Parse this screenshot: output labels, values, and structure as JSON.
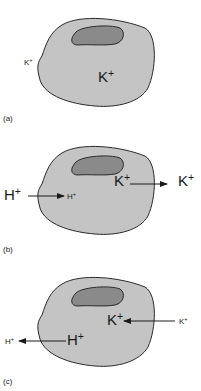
{
  "colors": {
    "cytoplasm": "#c4c4c4",
    "nucleus": "#8a8a8a",
    "outline": "#2a2a2a",
    "text": "#1a1a1a"
  },
  "panels": [
    {
      "label": "(a)",
      "outside_ion": "K+",
      "inside_ion": "K+"
    },
    {
      "label": "(b)",
      "influx_outside": "H+",
      "influx_inside": "H+",
      "efflux_inside": "K+",
      "efflux_outside": "K+"
    },
    {
      "label": "(c)",
      "efflux_inside": "H+",
      "efflux_outside": "H+",
      "influx_inside": "K+",
      "influx_outside": "K+"
    }
  ]
}
